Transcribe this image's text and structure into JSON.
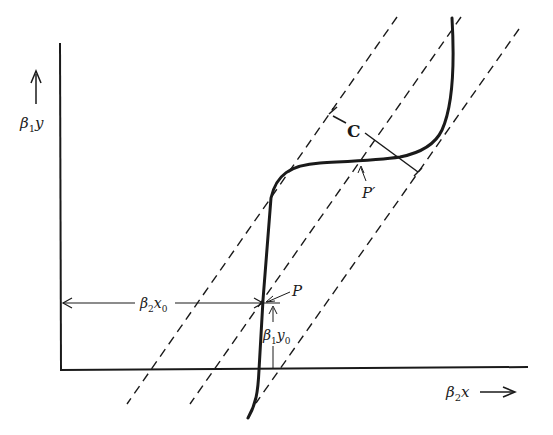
{
  "diagram": {
    "type": "phase-plane construction",
    "axes": {
      "y_label": {
        "main": "β",
        "sub": "1",
        "var": "y"
      },
      "x_label": {
        "main": "β",
        "sub": "2",
        "var": "x"
      }
    },
    "annotations": {
      "point_p": "P",
      "point_p_prime": "P′",
      "distance_c": "C",
      "x0_measure": {
        "main": "β",
        "sub": "2",
        "var": "x",
        "var_sub": "0"
      },
      "y0_measure": {
        "main": "β",
        "sub": "1",
        "var": "y",
        "var_sub": "0"
      }
    },
    "elements": [
      "y-axis with upward arrow",
      "x-axis with rightward arrow",
      "three parallel dashed lines",
      "S-shaped characteristic curve",
      "perpendicular distance C between outer dashed lines"
    ],
    "colors": {
      "ink": "#1a1a1a",
      "background": "#ffffff"
    }
  }
}
